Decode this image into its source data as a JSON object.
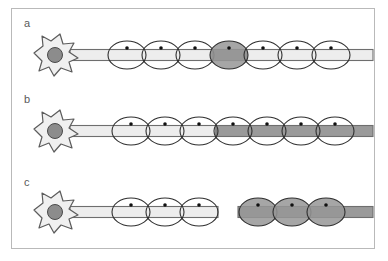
{
  "figure": {
    "background_color": "#ffffff",
    "frame_color": "#b9b9b9",
    "width": 388,
    "height": 261
  },
  "palette": {
    "outline": "#3a3a3a",
    "soma_fill": "#f0f0f0",
    "soma_stroke": "#5c5c5c",
    "nucleus_fill": "#8c8c8c",
    "nucleus_stroke": "#4a4a4a",
    "axon_light_fill": "#ededed",
    "axon_dark_fill": "#9a9a9a",
    "axon_stroke": "#6e6e6e",
    "sheath_light_fill": "#ffffff",
    "sheath_dark_fill": "#969696",
    "sheath_stroke": "#2f2f2f",
    "sheath_nucleus_fill": "#101010",
    "label_color": "#5a5a5a"
  },
  "panels": [
    {
      "id": "panel-a",
      "label": "a",
      "label_x": 24,
      "label_y": 27,
      "axis_y": 55,
      "soma": {
        "cx": 55,
        "cy": 55
      },
      "axon": {
        "x_start": 70,
        "x_end": 373,
        "height": 11,
        "dark_from": null,
        "dark_to": null,
        "broken": false
      },
      "sheaths": [
        {
          "cx": 127,
          "shade": "light"
        },
        {
          "cx": 161,
          "shade": "light"
        },
        {
          "cx": 195,
          "shade": "light"
        },
        {
          "cx": 229,
          "shade": "dark"
        },
        {
          "cx": 263,
          "shade": "light"
        },
        {
          "cx": 297,
          "shade": "light"
        },
        {
          "cx": 331,
          "shade": "light"
        }
      ],
      "dark_axon_segments": [
        {
          "x1": 212,
          "x2": 247
        }
      ],
      "description": "Intact axon with a single focally demyelinated internode shaded dark"
    },
    {
      "id": "panel-b",
      "label": "b",
      "label_x": 24,
      "label_y": 103,
      "axis_y": 131,
      "soma": {
        "cx": 55,
        "cy": 131
      },
      "axon": {
        "x_start": 70,
        "x_end": 373,
        "height": 11,
        "dark_from": 216,
        "dark_to": 373,
        "broken": false
      },
      "sheaths": [
        {
          "cx": 131,
          "shade": "light"
        },
        {
          "cx": 165,
          "shade": "light"
        },
        {
          "cx": 199,
          "shade": "light"
        },
        {
          "cx": 233,
          "shade": "light"
        },
        {
          "cx": 267,
          "shade": "light"
        },
        {
          "cx": 301,
          "shade": "light"
        },
        {
          "cx": 335,
          "shade": "light"
        }
      ],
      "dark_axon_segments": [],
      "description": "Axon darkened distally from mid-course while myelin sheaths remain pale"
    },
    {
      "id": "panel-c",
      "label": "c",
      "label_x": 24,
      "label_y": 186,
      "axis_y": 212,
      "soma": {
        "cx": 55,
        "cy": 212
      },
      "axon": {
        "x_start": 70,
        "x_end": 218,
        "height": 11,
        "dark_from": null,
        "dark_to": null,
        "broken": true
      },
      "distal_axon": {
        "x_start": 238,
        "x_end": 373,
        "height": 11
      },
      "sheaths": [
        {
          "cx": 131,
          "shade": "light"
        },
        {
          "cx": 165,
          "shade": "light"
        },
        {
          "cx": 199,
          "shade": "light"
        },
        {
          "cx": 258,
          "shade": "dark"
        },
        {
          "cx": 292,
          "shade": "dark"
        },
        {
          "cx": 326,
          "shade": "dark"
        }
      ],
      "dark_axon_segments": [],
      "description": "Transected axon: proximal stump pale, detached distal segment dark (Wallerian degeneration)"
    }
  ],
  "geometry": {
    "sheath_rx": 19,
    "sheath_ry": 14,
    "sheath_nucleus_r": 1.8,
    "sheath_nucleus_dy": -7
  }
}
